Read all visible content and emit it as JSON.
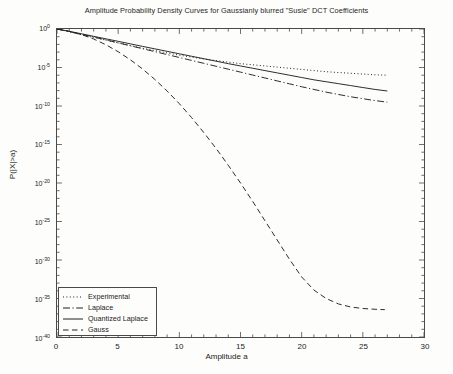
{
  "chart_data": {
    "type": "line",
    "title": "Amplitude Probability Density Curves for Gaussianly blurred \"Susie\" DCT Coefficients",
    "xlabel": "Amplitude a",
    "ylabel": "P(|X|>a)",
    "yscale": "log",
    "xlim": [
      0,
      30
    ],
    "ylim": [
      1e-40,
      1
    ],
    "xticks": [
      0,
      5,
      10,
      15,
      20,
      25,
      30
    ],
    "xticklabels": [
      "0",
      "5",
      "10",
      "15",
      "20",
      "25",
      "30"
    ],
    "yticks_exponent": [
      0,
      -5,
      -10,
      -15,
      -20,
      -25,
      -30,
      -35,
      -40
    ],
    "yticklabels": [
      "10^0",
      "10^-5",
      "10^-10",
      "10^-15",
      "10^-20",
      "10^-25",
      "10^-30",
      "10^-35",
      "10^-40"
    ],
    "grid": false,
    "legend_position": "lower left",
    "minor_ticks": true,
    "series": [
      {
        "name": "Experimental",
        "style": "dotted",
        "color": "#202020",
        "x": [
          0,
          1,
          2,
          3,
          4,
          5,
          6,
          7,
          8,
          9,
          10,
          11,
          12,
          13,
          14,
          15,
          16,
          17,
          18,
          19,
          20,
          21,
          22,
          23,
          24,
          25,
          26,
          27
        ],
        "y_exponent": [
          0,
          -0.35,
          -0.75,
          -1.1,
          -1.45,
          -1.8,
          -2.15,
          -2.5,
          -2.8,
          -3.1,
          -3.4,
          -3.65,
          -3.9,
          -4.1,
          -4.3,
          -4.5,
          -4.65,
          -4.8,
          -4.95,
          -5.1,
          -5.25,
          -5.4,
          -5.55,
          -5.65,
          -5.75,
          -5.85,
          -5.95,
          -6.0
        ]
      },
      {
        "name": "Laplace",
        "style": "dashdot",
        "color": "#202020",
        "x": [
          0,
          1,
          2,
          3,
          4,
          5,
          6,
          7,
          8,
          9,
          10,
          11,
          12,
          13,
          14,
          15,
          16,
          17,
          18,
          19,
          20,
          21,
          22,
          23,
          24,
          25,
          26,
          27
        ],
        "y_exponent": [
          0,
          -0.33,
          -0.7,
          -1.05,
          -1.42,
          -1.8,
          -2.18,
          -2.56,
          -2.94,
          -3.32,
          -3.7,
          -4.08,
          -4.46,
          -4.84,
          -5.22,
          -5.6,
          -5.98,
          -6.36,
          -6.74,
          -7.12,
          -7.5,
          -7.85,
          -8.2,
          -8.5,
          -8.8,
          -9.05,
          -9.3,
          -9.5
        ]
      },
      {
        "name": "Quantized Laplace",
        "style": "solid",
        "color": "#202020",
        "x": [
          0,
          1,
          2,
          3,
          4,
          5,
          6,
          7,
          8,
          9,
          10,
          11,
          12,
          13,
          14,
          15,
          16,
          17,
          18,
          19,
          20,
          21,
          22,
          23,
          24,
          25,
          26,
          27
        ],
        "y_exponent": [
          0,
          -0.3,
          -0.62,
          -0.95,
          -1.28,
          -1.6,
          -1.93,
          -2.26,
          -2.58,
          -2.9,
          -3.22,
          -3.54,
          -3.86,
          -4.18,
          -4.5,
          -4.8,
          -5.1,
          -5.4,
          -5.7,
          -6.0,
          -6.3,
          -6.6,
          -6.85,
          -7.1,
          -7.35,
          -7.6,
          -7.85,
          -8.05
        ]
      },
      {
        "name": "Gauss",
        "style": "dashed",
        "color": "#202020",
        "x": [
          0,
          1,
          2,
          3,
          4,
          5,
          6,
          7,
          8,
          9,
          10,
          11,
          12,
          13,
          14,
          15,
          16,
          17,
          18,
          19,
          20,
          21,
          22,
          23,
          24,
          25,
          26,
          26.8
        ],
        "y_exponent": [
          0,
          -0.3,
          -0.72,
          -1.3,
          -2.05,
          -2.95,
          -4.0,
          -5.2,
          -6.55,
          -8.05,
          -9.7,
          -11.5,
          -13.45,
          -15.5,
          -17.7,
          -20.0,
          -22.4,
          -24.9,
          -27.4,
          -29.9,
          -32.2,
          -33.9,
          -35.0,
          -35.7,
          -36.1,
          -36.3,
          -36.4,
          -36.45
        ]
      }
    ]
  },
  "legend": {
    "items": [
      {
        "label": "Experimental"
      },
      {
        "label": "Laplace"
      },
      {
        "label": "Quantized Laplace"
      },
      {
        "label": "Gauss"
      }
    ]
  }
}
